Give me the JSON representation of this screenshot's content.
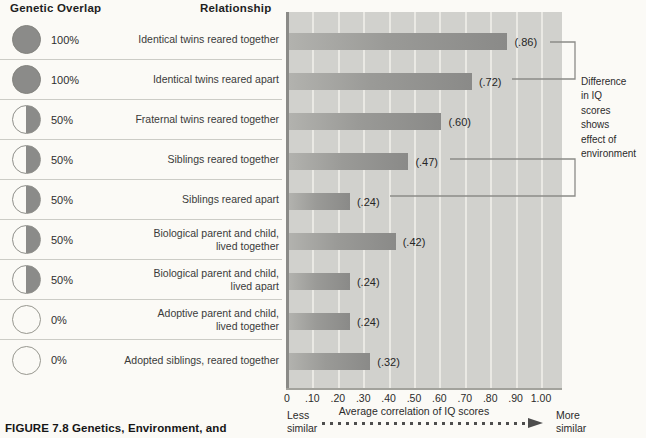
{
  "header": {
    "genetic_overlap": "Genetic Overlap",
    "relationship": "Relationship"
  },
  "rows": [
    {
      "overlap_pct": "100%",
      "circle": "full",
      "relationship": "Identical twins reared together",
      "value": 0.86,
      "value_label": "(.86)"
    },
    {
      "overlap_pct": "100%",
      "circle": "full",
      "relationship": "Identical twins reared apart",
      "value": 0.72,
      "value_label": "(.72)"
    },
    {
      "overlap_pct": "50%",
      "circle": "half",
      "relationship": "Fraternal twins reared together",
      "value": 0.6,
      "value_label": "(.60)"
    },
    {
      "overlap_pct": "50%",
      "circle": "half",
      "relationship": "Siblings reared together",
      "value": 0.47,
      "value_label": "(.47)"
    },
    {
      "overlap_pct": "50%",
      "circle": "half",
      "relationship": "Siblings reared apart",
      "value": 0.24,
      "value_label": "(.24)"
    },
    {
      "overlap_pct": "50%",
      "circle": "half",
      "relationship": "Biological parent and child,\nlived together",
      "value": 0.42,
      "value_label": "(.42)"
    },
    {
      "overlap_pct": "50%",
      "circle": "half",
      "relationship": "Biological parent and child,\nlived apart",
      "value": 0.24,
      "value_label": "(.24)"
    },
    {
      "overlap_pct": "0%",
      "circle": "empty",
      "relationship": "Adoptive parent and child,\nlived together",
      "value": 0.24,
      "value_label": "(.24)"
    },
    {
      "overlap_pct": "0%",
      "circle": "empty",
      "relationship": "Adopted siblings, reared together",
      "value": 0.32,
      "value_label": "(.32)"
    }
  ],
  "chart_data": {
    "type": "bar",
    "orientation": "horizontal",
    "title": "",
    "categories": [
      "Identical twins reared together",
      "Identical twins reared apart",
      "Fraternal twins reared together",
      "Siblings reared together",
      "Siblings reared apart",
      "Biological parent and child, lived together",
      "Biological parent and child, lived apart",
      "Adoptive parent and child, lived together",
      "Adopted siblings, reared together"
    ],
    "values": [
      0.86,
      0.72,
      0.6,
      0.47,
      0.24,
      0.42,
      0.24,
      0.24,
      0.32
    ],
    "value_labels": [
      "(.86)",
      "(.72)",
      "(.60)",
      "(.47)",
      "(.24)",
      "(.42)",
      "(.24)",
      "(.24)",
      "(.32)"
    ],
    "xlabel": "Average correlation of IQ scores",
    "xlim": [
      0,
      1.0
    ],
    "xticks": {
      "values": [
        0,
        0.1,
        0.2,
        0.3,
        0.4,
        0.5,
        0.6,
        0.7,
        0.8,
        0.9,
        1.0
      ],
      "labels": [
        "0",
        ".10",
        ".20",
        ".30",
        ".40",
        ".50",
        ".60",
        ".70",
        ".80",
        ".90",
        "1.00"
      ]
    },
    "grid": true,
    "legend": "none",
    "annotation_pairs": [
      {
        "from_label": "(.86)",
        "to_label": "(.72)"
      },
      {
        "from_label": "(.47)",
        "to_label": "(.24)"
      }
    ]
  },
  "annotation": {
    "text": "Difference\nin IQ\nscores\nshows\neffect of\nenvironment"
  },
  "arrow": {
    "left": "Less\nsimilar",
    "right": "More\nsimilar"
  },
  "caption": "FIGURE 7.8 Genetics, Environment, and",
  "colors": {
    "bar": "#8b8b89",
    "bar_light_edge": "#b2b2ae",
    "plot_background": "#d1d1cd",
    "gridline": "#eae9e4",
    "circle_fill": "#8b8b89",
    "page_background": "#fbfaf6",
    "text": "#2b2b2b"
  }
}
